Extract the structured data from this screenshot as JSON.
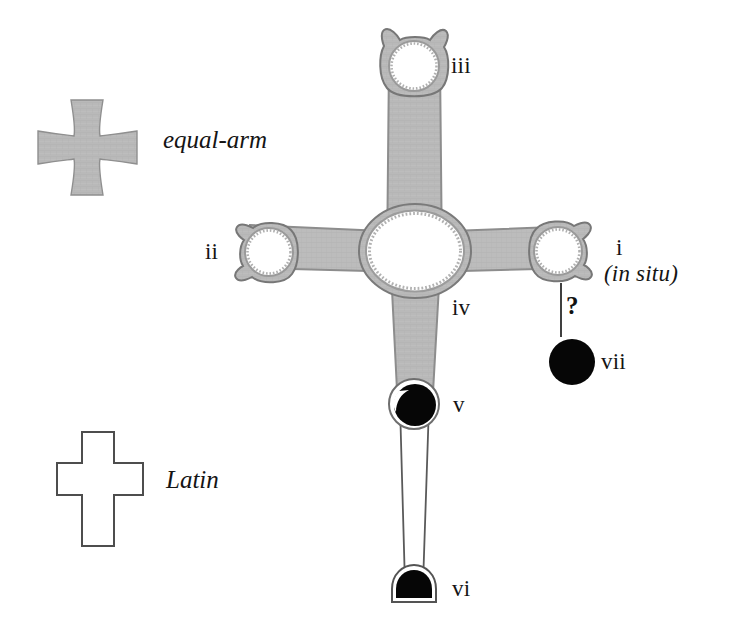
{
  "figure": {
    "background_color": "#ffffff"
  },
  "legend": {
    "items": [
      {
        "key": "equal-arm",
        "label": "equal-arm",
        "icon": "cross-pattee-icon",
        "style": "filled-gray"
      },
      {
        "key": "latin",
        "label": "Latin",
        "icon": "latin-cross-icon",
        "style": "outline"
      }
    ]
  },
  "colors": {
    "arm_fill": "#b7b7b7",
    "arm_stroke": "#8c8c8c",
    "outline": "#4a4a4a",
    "solid_black": "#050505",
    "paper": "#ffffff",
    "text": "#141414"
  },
  "labels": {
    "i": "i",
    "i_note": "(in situ)",
    "ii": "ii",
    "iii": "iii",
    "iv": "iv",
    "v": "v",
    "vi": "vi",
    "vii": "vii",
    "uncertain_marker": "?"
  },
  "parts": [
    {
      "id": "i",
      "label": "i",
      "note": "(in situ)",
      "description": "right arm terminal ring with lobes",
      "fill": "gray"
    },
    {
      "id": "ii",
      "label": "ii",
      "note": "",
      "description": "left arm terminal ring with lobes",
      "fill": "gray"
    },
    {
      "id": "iii",
      "label": "iii",
      "note": "",
      "description": "upper arm terminal ring with lobes",
      "fill": "gray"
    },
    {
      "id": "iv",
      "label": "iv",
      "note": "",
      "description": "central oval boss with beaded ring",
      "fill": "gray"
    },
    {
      "id": "v",
      "label": "v",
      "note": "",
      "description": "lower shaft upper disc, solid",
      "fill": "black"
    },
    {
      "id": "vi",
      "label": "vi",
      "note": "",
      "description": "lower shaft foot dome, solid",
      "fill": "black"
    },
    {
      "id": "vii",
      "label": "vii",
      "note": "",
      "description": "detached disc, solid",
      "fill": "black"
    }
  ],
  "connector": {
    "from": "i",
    "to": "vii",
    "marker": "?",
    "description": "uncertain association line from terminal i down to loose disc vii"
  }
}
